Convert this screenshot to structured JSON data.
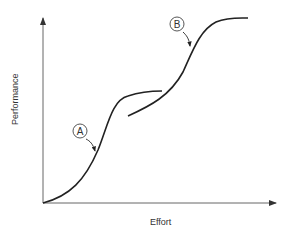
{
  "diagram": {
    "type": "s-curve",
    "x_axis_label": "Effort",
    "y_axis_label": "Performance",
    "curves": [
      {
        "id": "A",
        "label": "A",
        "description": "first S-curve"
      },
      {
        "id": "B",
        "label": "B",
        "description": "second S-curve"
      }
    ],
    "colors": {
      "line": "#222222",
      "axis": "#555555",
      "text": "#333333"
    }
  }
}
